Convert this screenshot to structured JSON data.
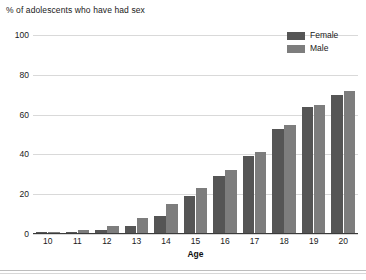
{
  "chart_data": {
    "type": "bar",
    "title": "% of adolescents who have had sex",
    "xlabel": "Age",
    "ylabel": "",
    "ylim": [
      0,
      100
    ],
    "ytick_step": 20,
    "yticks": [
      0,
      20,
      40,
      60,
      80,
      100
    ],
    "grid": true,
    "legend_position": "top-right",
    "categories": [
      "10",
      "11",
      "12",
      "13",
      "14",
      "15",
      "16",
      "17",
      "18",
      "19",
      "20"
    ],
    "series": [
      {
        "name": "Female",
        "color": "#555555",
        "values": [
          1,
          1,
          2,
          4,
          9,
          19,
          29,
          39,
          53,
          64,
          70
        ]
      },
      {
        "name": "Male",
        "color": "#7d7d7d",
        "values": [
          1,
          2,
          4,
          8,
          15,
          23,
          32,
          41,
          55,
          65,
          72
        ]
      }
    ]
  },
  "legend": {
    "items": [
      {
        "label": "Female",
        "color": "#555555"
      },
      {
        "label": "Male",
        "color": "#7d7d7d"
      }
    ]
  },
  "axis": {
    "x_title": "Age"
  }
}
